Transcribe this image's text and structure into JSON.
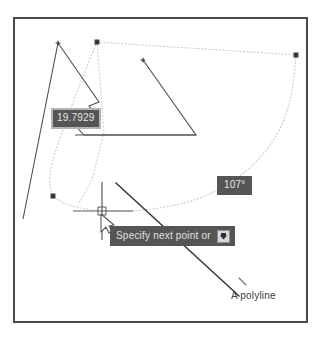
{
  "app": {
    "title": "CAD drawing canvas",
    "background_color": "#ffffff",
    "frame_color": "#4a4a4a"
  },
  "colors": {
    "geometry_stroke": "#4f4f4f",
    "active_rubber_band": "#3a3a3a",
    "construction_dotted": "#c9c9c9",
    "node_marker": "#2b2b2b",
    "tooltip_background": "#555555",
    "tooltip_text": "#e8e8e8",
    "tooltip_border": "#b4b4b4",
    "label_text": "#3b3b3b",
    "cursor_color": "#5a5a5a"
  },
  "dynamic_input": {
    "distance": {
      "value": "19.7929",
      "name": "distance-field"
    },
    "angle": {
      "value": "107°",
      "name": "angle-field"
    },
    "prompt": {
      "text": "Specify next point or",
      "dropdown_icon": "dropdown-arrow-icon"
    }
  },
  "annotations": {
    "polyline_label": "A polyline"
  },
  "cursor": {
    "type": "crosshair-with-arrow",
    "x": 102,
    "y": 211
  },
  "geometry": {
    "node_markers": [
      {
        "x": 97,
        "y": 42
      },
      {
        "x": 296,
        "y": 55
      },
      {
        "x": 53,
        "y": 196
      }
    ],
    "polyline_points": "58,43 97,101 89,105 96,114 72,121 83,133 196,135",
    "long_edge": "58,43 23,219",
    "triangle_points": "143,60 195,135 75,135",
    "rubber_band": "116,183 238,295",
    "construction_curve": "97,42 296,55 279,132 236,180 176,203 131,210 78,209 53,196 59,155 74,112 97,42"
  }
}
